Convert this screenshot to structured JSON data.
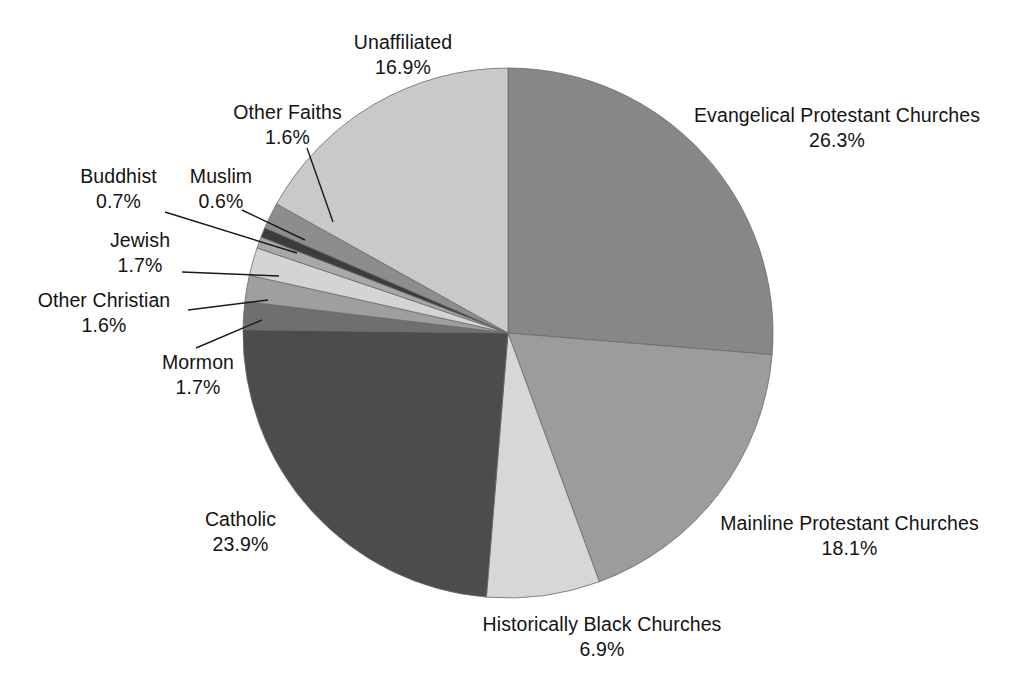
{
  "chart_data": {
    "type": "pie",
    "title": "",
    "subtitle": "",
    "xlabel": "",
    "ylabel": "",
    "legend_position": "none",
    "grid": false,
    "label_format": "name + percent",
    "start_angle_deg": 0,
    "direction": "clockwise",
    "units": "percent",
    "total": 100.0,
    "categories": [
      "Evangelical Protestant Churches",
      "Mainline Protestant Churches",
      "Historically Black Churches",
      "Catholic",
      "Mormon",
      "Other Christian",
      "Jewish",
      "Buddhist",
      "Muslim",
      "Other Faiths",
      "Unaffiliated"
    ],
    "values": [
      26.3,
      18.1,
      6.9,
      23.9,
      1.7,
      1.6,
      1.7,
      0.7,
      0.6,
      1.6,
      16.9
    ],
    "value_labels": [
      "26.3%",
      "18.1%",
      "6.9%",
      "23.9%",
      "1.7%",
      "1.6%",
      "1.7%",
      "0.7%",
      "0.6%",
      "1.6%",
      "16.9%"
    ],
    "colors": [
      "#878787",
      "#9c9c9c",
      "#d7d7d7",
      "#4c4c4c",
      "#6f6f6f",
      "#9f9f9f",
      "#d4d4d4",
      "#a8a8a8",
      "#3c3c3c",
      "#8d8d8d",
      "#c9c9c9"
    ],
    "slices": [
      {
        "name": "Evangelical Protestant Churches",
        "value": 26.3,
        "value_label": "26.3%",
        "color": "#878787"
      },
      {
        "name": "Mainline Protestant Churches",
        "value": 18.1,
        "value_label": "18.1%",
        "color": "#9c9c9c"
      },
      {
        "name": "Historically Black Churches",
        "value": 6.9,
        "value_label": "6.9%",
        "color": "#d7d7d7"
      },
      {
        "name": "Catholic",
        "value": 23.9,
        "value_label": "23.9%",
        "color": "#4c4c4c"
      },
      {
        "name": "Mormon",
        "value": 1.7,
        "value_label": "1.7%",
        "color": "#6f6f6f"
      },
      {
        "name": "Other Christian",
        "value": 1.6,
        "value_label": "1.6%",
        "color": "#9f9f9f"
      },
      {
        "name": "Jewish",
        "value": 1.7,
        "value_label": "1.7%",
        "color": "#d4d4d4"
      },
      {
        "name": "Buddhist",
        "value": 0.7,
        "value_label": "0.7%",
        "color": "#a8a8a8"
      },
      {
        "name": "Muslim",
        "value": 0.6,
        "value_label": "0.6%",
        "color": "#3c3c3c"
      },
      {
        "name": "Other Faiths",
        "value": 1.6,
        "value_label": "1.6%",
        "color": "#8d8d8d"
      },
      {
        "name": "Unaffiliated",
        "value": 16.9,
        "value_label": "16.9%",
        "color": "#c9c9c9"
      }
    ]
  },
  "labels": {
    "unaffiliated": {
      "name": "Unaffiliated",
      "pct": "16.9%"
    },
    "other_faiths": {
      "name": "Other Faiths",
      "pct": "1.6%"
    },
    "muslim": {
      "name": "Muslim",
      "pct": "0.6%"
    },
    "buddhist": {
      "name": "Buddhist",
      "pct": "0.7%"
    },
    "jewish": {
      "name": "Jewish",
      "pct": "1.7%"
    },
    "other_christian": {
      "name": "Other Christian",
      "pct": "1.6%"
    },
    "mormon": {
      "name": "Mormon",
      "pct": "1.7%"
    },
    "catholic": {
      "name": "Catholic",
      "pct": "23.9%"
    },
    "hist_black": {
      "name": "Historically Black Churches",
      "pct": "6.9%"
    },
    "mainline": {
      "name": "Mainline Protestant Churches",
      "pct": "18.1%"
    },
    "evangelical": {
      "name": "Evangelical Protestant Churches",
      "pct": "26.3%"
    }
  }
}
